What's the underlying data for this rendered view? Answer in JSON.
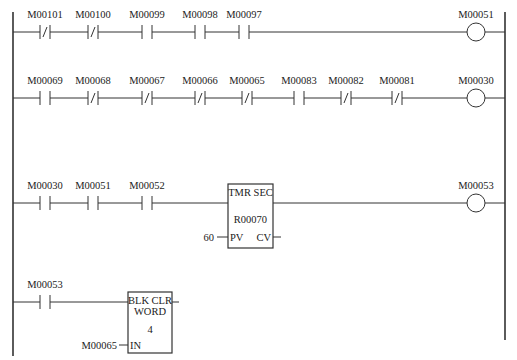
{
  "diagram": {
    "type": "ladder-logic",
    "rails": {
      "left_x": 13,
      "right_x": 505,
      "top_y": 12,
      "left_bottom_y": 356,
      "right_bottom_y": 340
    },
    "rungs": [
      {
        "y": 32,
        "contacts": [
          {
            "label": "M00101",
            "type": "NC",
            "x": 45
          },
          {
            "label": "M00100",
            "type": "NC",
            "x": 93
          },
          {
            "label": "M00099",
            "type": "NO",
            "x": 147
          },
          {
            "label": "M00098",
            "type": "NO",
            "x": 200
          },
          {
            "label": "M00097",
            "type": "NO",
            "x": 244
          }
        ],
        "coil": {
          "label": "M00051",
          "x": 476
        }
      },
      {
        "y": 98,
        "contacts": [
          {
            "label": "M00069",
            "type": "NO",
            "x": 45
          },
          {
            "label": "M00068",
            "type": "NC",
            "x": 93
          },
          {
            "label": "M00067",
            "type": "NC",
            "x": 147
          },
          {
            "label": "M00066",
            "type": "NC",
            "x": 200
          },
          {
            "label": "M00065",
            "type": "NC",
            "x": 247
          },
          {
            "label": "M00083",
            "type": "NO",
            "x": 299
          },
          {
            "label": "M00082",
            "type": "NC",
            "x": 346
          },
          {
            "label": "M00081",
            "type": "NC",
            "x": 397
          }
        ],
        "coil": {
          "label": "M00030",
          "x": 476
        }
      },
      {
        "y": 203,
        "contacts": [
          {
            "label": "M00030",
            "type": "NO",
            "x": 45
          },
          {
            "label": "M00051",
            "type": "NO",
            "x": 93
          },
          {
            "label": "M00052",
            "type": "NO",
            "x": 147
          }
        ],
        "function_block": {
          "title": "TMR SEC",
          "register": "R00070",
          "input_value": "60",
          "input_pin": "PV",
          "output_pin": "CV",
          "x": 228,
          "y": 184,
          "w": 45,
          "h": 64
        },
        "coil": {
          "label": "M00053",
          "x": 476
        }
      },
      {
        "y": 302,
        "contacts": [
          {
            "label": "M00053",
            "type": "NO",
            "x": 45
          }
        ],
        "function_block": {
          "title_line1": "BLK CLR",
          "title_line2": "WORD",
          "length": "4",
          "input_value": "M00065",
          "input_pin": "IN",
          "x": 128,
          "y": 292,
          "w": 44,
          "h": 61
        }
      }
    ]
  }
}
